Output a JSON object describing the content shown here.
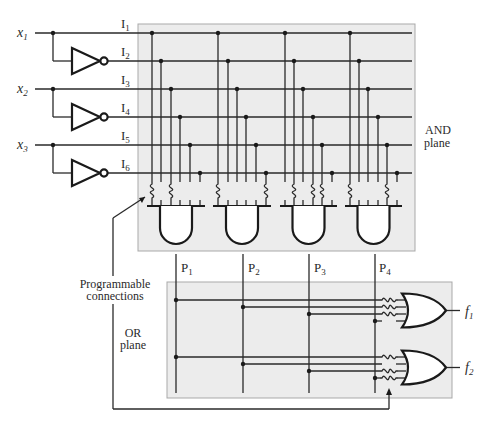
{
  "figure": {
    "inputs": [
      {
        "name": "x",
        "sub": "1"
      },
      {
        "name": "x",
        "sub": "2"
      },
      {
        "name": "x",
        "sub": "3"
      }
    ],
    "input_lines": [
      {
        "name": "I",
        "sub": "1"
      },
      {
        "name": "I",
        "sub": "2"
      },
      {
        "name": "I",
        "sub": "3"
      },
      {
        "name": "I",
        "sub": "4"
      },
      {
        "name": "I",
        "sub": "5"
      },
      {
        "name": "I",
        "sub": "6"
      }
    ],
    "products": [
      {
        "name": "P",
        "sub": "1"
      },
      {
        "name": "P",
        "sub": "2"
      },
      {
        "name": "P",
        "sub": "3"
      },
      {
        "name": "P",
        "sub": "4"
      }
    ],
    "outputs": [
      {
        "name": "f",
        "sub": "1"
      },
      {
        "name": "f",
        "sub": "2"
      }
    ],
    "labels": {
      "and_plane_line1": "AND",
      "and_plane_line2": "plane",
      "or_plane_line1": "OR",
      "or_plane_line2": "plane",
      "programmable_line1": "Programmable",
      "programmable_line2": "connections"
    },
    "and_plane_fuses": [
      [
        1,
        3
      ],
      [
        1,
        6
      ],
      [
        2,
        4,
        5
      ],
      [
        1,
        5
      ]
    ],
    "or_plane_fuses": [
      [
        1,
        2,
        3
      ],
      [
        1,
        3,
        4
      ]
    ],
    "colors": {
      "plane_fill": "#ececec",
      "plane_border": "#a9a9a9",
      "wire": "#2a2a2a"
    }
  }
}
